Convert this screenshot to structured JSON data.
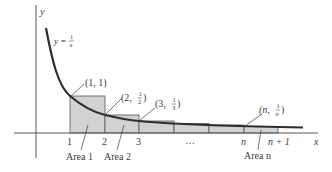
{
  "diagram": {
    "axes": {
      "x_label": "x",
      "y_label": "y"
    },
    "curve": {
      "equation_prefix": "y = ",
      "equation_num": "1",
      "equation_den": "x"
    },
    "points": [
      {
        "label_pre": "(1, 1)",
        "label": "(1, 1)"
      },
      {
        "label_pre": "(2, ",
        "num": "1",
        "den": "2",
        "label_post": ")"
      },
      {
        "label_pre": "(3, ",
        "num": "1",
        "den": "3",
        "label_post": ")"
      },
      {
        "label_pre": "(n, ",
        "num": "1",
        "den": "n",
        "label_post": ")"
      }
    ],
    "ticks": [
      "1",
      "2",
      "3",
      "…",
      "n",
      "n + 1"
    ],
    "areas": [
      "Area 1",
      "Area 2",
      "Area n"
    ],
    "colors": {
      "curve": "#2e2e2e",
      "rect_fill": "#d2d2d2",
      "rect_stroke": "#555555",
      "axis": "#555555",
      "text": "#3a3a3a"
    }
  }
}
